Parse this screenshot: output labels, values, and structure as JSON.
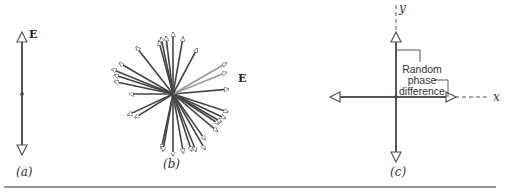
{
  "panels": {
    "a": {
      "caption": "(a)",
      "vector_label": "E"
    },
    "b": {
      "caption": "(b)",
      "vector_label": "E"
    },
    "c": {
      "caption": "(c)",
      "x_axis_label": "x",
      "y_axis_label": "y",
      "annotation_lines": [
        "Random",
        "phase",
        "difference"
      ]
    }
  },
  "colors": {
    "line": "#555555",
    "background": "#ffffff",
    "rule": "#777777"
  }
}
